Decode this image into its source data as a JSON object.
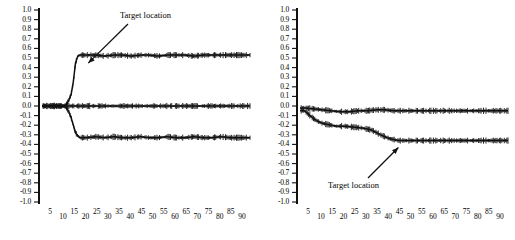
{
  "chart_data": [
    {
      "id": "left",
      "type": "line",
      "title": "",
      "xlabel": "",
      "ylabel": "",
      "xlim": [
        0,
        93
      ],
      "ylim": [
        -1.0,
        1.0
      ],
      "grid": false,
      "legend": "none",
      "ytick_labels": [
        "1.0",
        "0.9",
        "0.8",
        "0.7",
        "0.6",
        "0.5",
        "0.4",
        "0.3",
        "0.2",
        "0.1",
        "0.0",
        "-0.1",
        "-0.2",
        "-0.3",
        "-0.4",
        "-0.5",
        "-0.6",
        "-0.7",
        "-0.8",
        "-0.9",
        "-1.0"
      ],
      "ytick_values": [
        1.0,
        0.9,
        0.8,
        0.7,
        0.6,
        0.5,
        0.4,
        0.3,
        0.2,
        0.1,
        0.0,
        -0.1,
        -0.2,
        -0.3,
        -0.4,
        -0.5,
        -0.6,
        -0.7,
        -0.8,
        -0.9,
        -1.0
      ],
      "xtick_labels": [
        "5",
        "10",
        "15",
        "20",
        "25",
        "30",
        "35",
        "40",
        "45",
        "50",
        "55",
        "60",
        "65",
        "70",
        "75",
        "80",
        "85",
        "90"
      ],
      "xtick_values": [
        5,
        10,
        15,
        20,
        25,
        30,
        35,
        40,
        45,
        50,
        55,
        60,
        65,
        70,
        75,
        80,
        85,
        90
      ],
      "annotations": [
        {
          "text": "Target location",
          "arrow_to_x": 18,
          "arrow_to_y": 0.53
        }
      ],
      "series": [
        {
          "name": "upper-trace",
          "x": [
            2,
            4,
            6,
            8,
            10,
            11,
            12,
            13,
            14,
            15,
            16,
            17,
            18,
            20,
            24,
            28,
            32,
            36,
            40,
            44,
            48,
            52,
            56,
            60,
            64,
            68,
            72,
            76,
            80,
            84,
            88,
            90
          ],
          "values": [
            0.0,
            0.0,
            0.0,
            0.0,
            0.0,
            0.02,
            0.06,
            0.12,
            0.25,
            0.45,
            0.52,
            0.53,
            0.53,
            0.53,
            0.53,
            0.52,
            0.53,
            0.53,
            0.52,
            0.53,
            0.53,
            0.52,
            0.53,
            0.53,
            0.53,
            0.52,
            0.53,
            0.53,
            0.53,
            0.53,
            0.53,
            0.53
          ]
        },
        {
          "name": "middle-trace",
          "x": [
            2,
            10,
            20,
            30,
            40,
            50,
            60,
            70,
            80,
            90
          ],
          "values": [
            0.0,
            0.0,
            0.0,
            0.0,
            0.0,
            0.0,
            0.0,
            0.0,
            0.0,
            0.0
          ]
        },
        {
          "name": "lower-trace",
          "x": [
            2,
            4,
            6,
            8,
            10,
            11,
            12,
            13,
            14,
            15,
            16,
            17,
            18,
            20,
            24,
            28,
            32,
            36,
            40,
            44,
            48,
            52,
            56,
            60,
            64,
            68,
            72,
            76,
            80,
            84,
            88,
            90
          ],
          "values": [
            0.0,
            0.0,
            0.0,
            0.0,
            0.0,
            -0.02,
            -0.06,
            -0.12,
            -0.2,
            -0.28,
            -0.31,
            -0.33,
            -0.33,
            -0.33,
            -0.32,
            -0.33,
            -0.32,
            -0.33,
            -0.33,
            -0.32,
            -0.33,
            -0.33,
            -0.32,
            -0.33,
            -0.33,
            -0.32,
            -0.33,
            -0.33,
            -0.32,
            -0.33,
            -0.33,
            -0.33
          ]
        }
      ]
    },
    {
      "id": "right",
      "type": "line",
      "title": "",
      "xlabel": "",
      "ylabel": "",
      "xlim": [
        0,
        93
      ],
      "ylim": [
        -1.0,
        1.0
      ],
      "grid": false,
      "legend": "none",
      "ytick_labels": [
        "1.0",
        "0.9",
        "0.8",
        "0.7",
        "0.6",
        "0.5",
        "0.4",
        "0.3",
        "0.2",
        "0.1",
        "0.0",
        "-0.1",
        "-0.2",
        "-0.3",
        "-0.4",
        "-0.5",
        "-0.6",
        "-0.7",
        "-0.8",
        "-0.9",
        "-1.0"
      ],
      "ytick_values": [
        1.0,
        0.9,
        0.8,
        0.7,
        0.6,
        0.5,
        0.4,
        0.3,
        0.2,
        0.1,
        0.0,
        -0.1,
        -0.2,
        -0.3,
        -0.4,
        -0.5,
        -0.6,
        -0.7,
        -0.8,
        -0.9,
        -1.0
      ],
      "xtick_labels": [
        "5",
        "10",
        "15",
        "20",
        "25",
        "30",
        "35",
        "40",
        "45",
        "50",
        "55",
        "60",
        "65",
        "70",
        "75",
        "80",
        "85",
        "90"
      ],
      "xtick_values": [
        5,
        10,
        15,
        20,
        25,
        30,
        35,
        40,
        45,
        50,
        55,
        60,
        65,
        70,
        75,
        80,
        85,
        90
      ],
      "annotations": [
        {
          "text": "Target location",
          "arrow_to_x": 44,
          "arrow_to_y": -0.36
        }
      ],
      "series": [
        {
          "name": "upper-trace",
          "x": [
            2,
            6,
            10,
            14,
            18,
            22,
            26,
            30,
            34,
            38,
            42,
            46,
            50,
            54,
            58,
            62,
            66,
            70,
            74,
            78,
            82,
            86,
            90
          ],
          "values": [
            -0.02,
            -0.03,
            -0.04,
            -0.05,
            -0.06,
            -0.06,
            -0.05,
            -0.05,
            -0.04,
            -0.04,
            -0.05,
            -0.05,
            -0.05,
            -0.05,
            -0.05,
            -0.05,
            -0.05,
            -0.05,
            -0.05,
            -0.05,
            -0.05,
            -0.05,
            -0.05
          ]
        },
        {
          "name": "lower-trace",
          "x": [
            2,
            4,
            6,
            8,
            10,
            12,
            14,
            16,
            20,
            24,
            28,
            32,
            36,
            40,
            44,
            48,
            52,
            56,
            60,
            64,
            68,
            72,
            76,
            80,
            84,
            88,
            90
          ],
          "values": [
            -0.05,
            -0.09,
            -0.13,
            -0.16,
            -0.18,
            -0.19,
            -0.2,
            -0.21,
            -0.21,
            -0.22,
            -0.23,
            -0.25,
            -0.3,
            -0.34,
            -0.36,
            -0.36,
            -0.36,
            -0.36,
            -0.36,
            -0.36,
            -0.36,
            -0.36,
            -0.36,
            -0.36,
            -0.36,
            -0.36,
            -0.36
          ]
        }
      ]
    }
  ],
  "panels": {
    "left": {
      "annotation_label": "Target location",
      "ylabels": [
        "1.0",
        "0.9",
        "0.8",
        "0.7",
        "0.6",
        "0.5",
        "0.4",
        "0.3",
        "0.2",
        "0.1",
        "0.0",
        "-0.1",
        "-0.2",
        "-0.3",
        "-0.4",
        "-0.5",
        "-0.6",
        "-0.7",
        "-0.8",
        "-0.9",
        "-1.0"
      ],
      "xlabels": [
        "5",
        "10",
        "15",
        "20",
        "25",
        "30",
        "35",
        "40",
        "45",
        "50",
        "55",
        "60",
        "65",
        "70",
        "75",
        "80",
        "85",
        "90"
      ]
    },
    "right": {
      "annotation_label": "Target location",
      "ylabels": [
        "1.0",
        "0.9",
        "0.8",
        "0.7",
        "0.6",
        "0.5",
        "0.4",
        "0.3",
        "0.2",
        "0.1",
        "0.0",
        "-0.1",
        "-0.2",
        "-0.3",
        "-0.4",
        "-0.5",
        "-0.6",
        "-0.7",
        "-0.8",
        "-0.9",
        "-1.0"
      ],
      "xlabels": [
        "5",
        "10",
        "15",
        "20",
        "25",
        "30",
        "35",
        "40",
        "45",
        "50",
        "55",
        "60",
        "65",
        "70",
        "75",
        "80",
        "85",
        "90"
      ]
    }
  }
}
